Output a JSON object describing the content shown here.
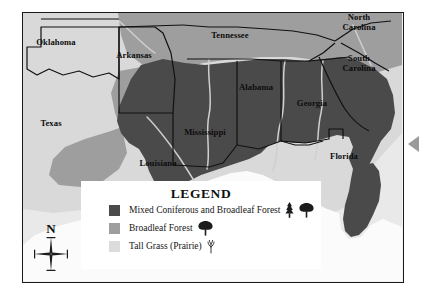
{
  "map": {
    "title": "Vegetation regions of the southeastern United States",
    "frame_border_color": "#1a1a1a",
    "background_color": "#ffffff",
    "ocean_color": "#fbfbfb",
    "colors": {
      "mixed_forest": "#4a4a4a",
      "broadleaf_forest": "#9e9e9e",
      "tall_grass": "#d9d9d9",
      "outside_land": "#e8e8e8",
      "state_border": "#111111",
      "river": "#cfcfcf"
    },
    "state_labels": [
      {
        "name": "Oklahoma",
        "lines": [
          "Oklahoma"
        ],
        "x": 55,
        "y": 43
      },
      {
        "name": "Arkansas",
        "lines": [
          "Arkansas"
        ],
        "x": 133,
        "y": 56
      },
      {
        "name": "Tennessee",
        "lines": [
          "Tennessee"
        ],
        "x": 229,
        "y": 36
      },
      {
        "name": "North Carolina",
        "lines": [
          "North",
          "Carolina"
        ],
        "x": 358,
        "y": 18
      },
      {
        "name": "South Carolina",
        "lines": [
          "South",
          "Carolina"
        ],
        "x": 358,
        "y": 59
      },
      {
        "name": "Alabama",
        "lines": [
          "Alabama"
        ],
        "x": 256,
        "y": 88
      },
      {
        "name": "Georgia",
        "lines": [
          "Georgia"
        ],
        "x": 312,
        "y": 104
      },
      {
        "name": "Texas",
        "lines": [
          "Texas"
        ],
        "x": 51,
        "y": 124
      },
      {
        "name": "Mississippi",
        "lines": [
          "Mississippi"
        ],
        "x": 205,
        "y": 133
      },
      {
        "name": "Louisiana",
        "lines": [
          "Louisiana"
        ],
        "x": 158,
        "y": 164
      },
      {
        "name": "Florida",
        "lines": [
          "Florida"
        ],
        "x": 344,
        "y": 157
      }
    ]
  },
  "legend": {
    "title": "LEGEND",
    "items": [
      {
        "label": "Mixed Coniferous and Broadleaf Forest",
        "color": "#4a4a4a",
        "icons": [
          "conifer-tree-icon",
          "broadleaf-tree-icon"
        ]
      },
      {
        "label": "Broadleaf Forest",
        "color": "#9e9e9e",
        "icons": [
          "broadleaf-tree-icon"
        ]
      },
      {
        "label": "Tall Grass (Prairie)",
        "color": "#dcdcdc",
        "icons": [
          "grass-tuft-icon"
        ]
      }
    ]
  },
  "compass": {
    "north_label": "N",
    "icon": "compass-rose-icon"
  },
  "edge_marker": {
    "icon": "left-pointing-triangle-icon",
    "color": "#9a9a9a"
  }
}
